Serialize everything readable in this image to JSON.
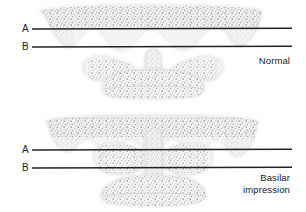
{
  "figure": {
    "background_color": "#ffffff",
    "line_color": "#222222",
    "bone_fill_color": "#f2f2f2",
    "bone_outline_color": "#cfcfcf",
    "stipple_color": "#8d8d93",
    "text_color": "#1a1a1a",
    "width": 306,
    "height": 212
  },
  "panels": [
    {
      "id": "normal",
      "caption": "Normal",
      "caption_lines": [
        "Normal"
      ],
      "reference_lines": [
        {
          "label": "A",
          "name": "chamberlain-line",
          "y": 29,
          "x_start": 32,
          "x_end": 292
        },
        {
          "label": "B",
          "name": "mcgregor-line",
          "y": 47,
          "x_start": 32,
          "x_end": 292
        }
      ],
      "structures": [
        {
          "name": "skull-base",
          "description": "Occipital bone / skull base with cancellous bone stippling"
        },
        {
          "name": "petrous-apex-left",
          "description": "Left downward bony projection"
        },
        {
          "name": "petrous-apex-right",
          "description": "Right downward bony projection"
        },
        {
          "name": "atlas-lateral-mass-left",
          "description": "Left lateral mass of C1"
        },
        {
          "name": "atlas-lateral-mass-right",
          "description": "Right lateral mass of C1"
        },
        {
          "name": "odontoid-process",
          "description": "Dens of C2 below line B"
        },
        {
          "name": "axis-vertebral-body",
          "description": "C2 vertebral body"
        }
      ]
    },
    {
      "id": "basilar-impression",
      "caption": "Basilar impression",
      "caption_lines": [
        "Basilar",
        "impression"
      ],
      "reference_lines": [
        {
          "label": "A",
          "name": "chamberlain-line",
          "y": 150,
          "x_start": 32,
          "x_end": 292
        },
        {
          "label": "B",
          "name": "mcgregor-line",
          "y": 168,
          "x_start": 32,
          "x_end": 292
        }
      ],
      "structures": [
        {
          "name": "skull-base",
          "description": "Occipital bone / skull base with cancellous bone stippling"
        },
        {
          "name": "petrous-apex-left",
          "description": "Left downward bony projection"
        },
        {
          "name": "petrous-apex-right",
          "description": "Right downward bony projection"
        },
        {
          "name": "atlas-lateral-mass-left",
          "description": "Left lateral mass of C1"
        },
        {
          "name": "atlas-lateral-mass-right",
          "description": "Right lateral mass of C1"
        },
        {
          "name": "odontoid-process",
          "description": "Dens of C2 projecting above lines A and B"
        },
        {
          "name": "axis-vertebral-body",
          "description": "C2 vertebral body"
        }
      ]
    }
  ]
}
